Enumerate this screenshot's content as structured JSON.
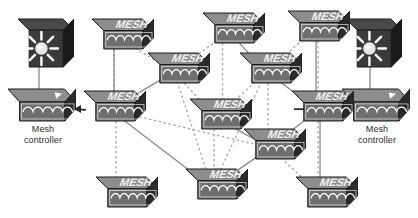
{
  "diagram": {
    "background": "#ffffff",
    "width": 418,
    "height": 218
  },
  "palette": {
    "node_top": "#8d8d8d",
    "node_front": "#6e6e6e",
    "node_side": "#2a2a2a",
    "node_outline": "#1c1c1c",
    "wave_color": "#ffffff",
    "mesh_text": "#f2f2f2",
    "ap_box_top": "#4a4a4a",
    "ap_box_front": "#3a3a3a",
    "ap_box_side": "#1a1a1a",
    "link_solid": "#8a8a8a",
    "link_dashed": "#a6a6a6",
    "label_text": "#2b2b2b"
  },
  "labels": {
    "mesh_node": "MESH",
    "controller_left": "Mesh\ncontroller",
    "controller_right": "Mesh\ncontroller"
  },
  "devices": [
    {
      "id": "ap-left",
      "kind": "access-point",
      "name": "access-point-left",
      "x": 18,
      "y": 18,
      "w": 56,
      "h": 50
    },
    {
      "id": "ctl-left",
      "kind": "mesh-controller",
      "name": "mesh-controller-left",
      "x": 8,
      "y": 88,
      "w": 68,
      "h": 34,
      "label": "controller_left",
      "label_x": 7,
      "label_y": 124,
      "label_w": 72
    },
    {
      "id": "ap-right",
      "kind": "access-point",
      "name": "access-point-right",
      "x": 346,
      "y": 18,
      "w": 56,
      "h": 50
    },
    {
      "id": "ctl-right",
      "kind": "mesh-controller",
      "name": "mesh-controller-right",
      "x": 342,
      "y": 88,
      "w": 68,
      "h": 34,
      "label": "controller_right",
      "label_x": 341,
      "label_y": 124,
      "label_w": 72
    },
    {
      "id": "m1",
      "kind": "mesh-node",
      "name": "mesh-node-1",
      "x": 92,
      "y": 18,
      "w": 62,
      "h": 32
    },
    {
      "id": "m2",
      "kind": "mesh-node",
      "name": "mesh-node-2",
      "x": 203,
      "y": 12,
      "w": 62,
      "h": 32
    },
    {
      "id": "m3",
      "kind": "mesh-node",
      "name": "mesh-node-3",
      "x": 288,
      "y": 10,
      "w": 62,
      "h": 32
    },
    {
      "id": "m4",
      "kind": "mesh-node",
      "name": "mesh-node-4",
      "x": 148,
      "y": 52,
      "w": 62,
      "h": 32
    },
    {
      "id": "m5",
      "kind": "mesh-node",
      "name": "mesh-node-5",
      "x": 240,
      "y": 52,
      "w": 62,
      "h": 32
    },
    {
      "id": "m6",
      "kind": "mesh-node",
      "name": "mesh-node-6",
      "x": 84,
      "y": 90,
      "w": 62,
      "h": 32
    },
    {
      "id": "m7",
      "kind": "mesh-node",
      "name": "mesh-node-7",
      "x": 190,
      "y": 98,
      "w": 62,
      "h": 32
    },
    {
      "id": "m8",
      "kind": "mesh-node",
      "name": "mesh-node-8",
      "x": 292,
      "y": 90,
      "w": 62,
      "h": 32
    },
    {
      "id": "m9",
      "kind": "mesh-node",
      "name": "mesh-node-9",
      "x": 244,
      "y": 128,
      "w": 62,
      "h": 32
    },
    {
      "id": "m10",
      "kind": "mesh-node",
      "name": "mesh-node-10",
      "x": 96,
      "y": 176,
      "w": 62,
      "h": 32
    },
    {
      "id": "m11",
      "kind": "mesh-node",
      "name": "mesh-node-11",
      "x": 186,
      "y": 168,
      "w": 62,
      "h": 32
    },
    {
      "id": "m12",
      "kind": "mesh-node",
      "name": "mesh-node-12",
      "x": 296,
      "y": 176,
      "w": 62,
      "h": 32
    }
  ],
  "links": [
    {
      "from": "ap-left",
      "to": "ctl-left",
      "style": "solid",
      "name": "link-ap-left-controller"
    },
    {
      "from": "ap-right",
      "to": "ctl-right",
      "style": "solid",
      "name": "link-ap-right-controller"
    },
    {
      "from": "m6",
      "to": "ctl-left",
      "style": "arrow-left",
      "name": "link-mesh6-controller-left"
    },
    {
      "from": "m8",
      "to": "ctl-right",
      "style": "arrow-right",
      "name": "link-mesh8-controller-right"
    },
    {
      "from": "m1",
      "to": "m6",
      "style": "solid",
      "name": "link-m1-m6"
    },
    {
      "from": "m1",
      "to": "m6",
      "style": "dashed",
      "name": "link-m1-m6-alt"
    },
    {
      "from": "m1",
      "to": "m4",
      "style": "dashed",
      "name": "link-m1-m4"
    },
    {
      "from": "m2",
      "to": "m4",
      "style": "dashed",
      "name": "link-m2-m4"
    },
    {
      "from": "m2",
      "to": "m5",
      "style": "solid",
      "name": "link-m2-m5"
    },
    {
      "from": "m2",
      "to": "m7",
      "style": "dashed",
      "name": "link-m2-m7"
    },
    {
      "from": "m3",
      "to": "m5",
      "style": "dashed",
      "name": "link-m3-m5"
    },
    {
      "from": "m3",
      "to": "m8",
      "style": "solid",
      "name": "link-m3-m8"
    },
    {
      "from": "m4",
      "to": "m6",
      "style": "solid",
      "name": "link-m4-m6"
    },
    {
      "from": "m4",
      "to": "m7",
      "style": "dashed",
      "name": "link-m4-m7"
    },
    {
      "from": "m4",
      "to": "m11",
      "style": "dashed",
      "name": "link-m4-m11"
    },
    {
      "from": "m5",
      "to": "m7",
      "style": "dashed",
      "name": "link-m5-m7"
    },
    {
      "from": "m5",
      "to": "m8",
      "style": "solid",
      "name": "link-m5-m8"
    },
    {
      "from": "m5",
      "to": "m9",
      "style": "dashed",
      "name": "link-m5-m9"
    },
    {
      "from": "m6",
      "to": "m9",
      "style": "dashed",
      "name": "link-m6-m9"
    },
    {
      "from": "m6",
      "to": "m10",
      "style": "dashed",
      "name": "link-m6-m10"
    },
    {
      "from": "m6",
      "to": "m11",
      "style": "solid",
      "name": "link-m6-m11"
    },
    {
      "from": "m7",
      "to": "m9",
      "style": "solid",
      "name": "link-m7-m9"
    },
    {
      "from": "m7",
      "to": "m11",
      "style": "dashed",
      "name": "link-m7-m11"
    },
    {
      "from": "m8",
      "to": "m9",
      "style": "solid",
      "name": "link-m8-m9"
    },
    {
      "from": "m8",
      "to": "m12",
      "style": "solid",
      "name": "link-m8-m12"
    },
    {
      "from": "m9",
      "to": "m12",
      "style": "dashed",
      "name": "link-m9-m12"
    },
    {
      "from": "m9",
      "to": "m11",
      "style": "solid",
      "name": "link-m9-m11"
    },
    {
      "from": "m3",
      "to": "m12",
      "style": "dashed",
      "name": "link-m3-m12"
    },
    {
      "from": "m11",
      "to": "m5",
      "style": "dashed",
      "name": "link-m11-m5"
    }
  ]
}
